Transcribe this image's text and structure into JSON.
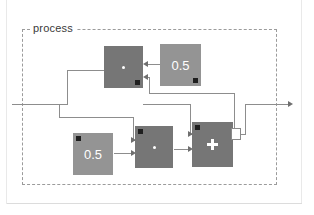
{
  "diagram": {
    "title": "process",
    "kind": "block-diagram",
    "subsystem_label": "process",
    "blocks": [
      {
        "id": "mul-top",
        "name": "multiply-block-top",
        "label": "*",
        "symbol": "star-dot",
        "fill": "#767676",
        "marker": "bottom-right",
        "x": 104,
        "y": 46,
        "w": 39,
        "h": 42
      },
      {
        "id": "const-top",
        "name": "constant-block-top",
        "label": "0.5",
        "symbol": "text",
        "fill": "#949494",
        "marker": "bottom-right",
        "x": 160,
        "y": 44,
        "w": 41,
        "h": 42
      },
      {
        "id": "const-bottom",
        "name": "constant-block-bottom",
        "label": "0.5",
        "symbol": "text",
        "fill": "#949494",
        "marker": "top-left",
        "x": 73,
        "y": 133,
        "w": 40,
        "h": 42
      },
      {
        "id": "mul-bottom",
        "name": "multiply-block-bottom",
        "label": "*",
        "symbol": "star-dot",
        "fill": "#767676",
        "marker": "top-left",
        "x": 135,
        "y": 126,
        "w": 38,
        "h": 42
      },
      {
        "id": "sum",
        "name": "sum-block",
        "label": "+",
        "symbol": "plus",
        "fill": "#767676",
        "marker": "top-left",
        "x": 192,
        "y": 122,
        "w": 41,
        "h": 45
      }
    ],
    "junction": {
      "name": "junction-box",
      "x": 231,
      "y": 128,
      "w": 10,
      "h": 12
    },
    "ports": {
      "input_label": "",
      "output_label": ""
    },
    "colors": {
      "block_dark": "#767676",
      "block_medium": "#949494",
      "wire": "#8d8d8d",
      "boundary": "#9b9b9b",
      "marker": "#1e1e1e",
      "background": "#ffffff"
    }
  }
}
